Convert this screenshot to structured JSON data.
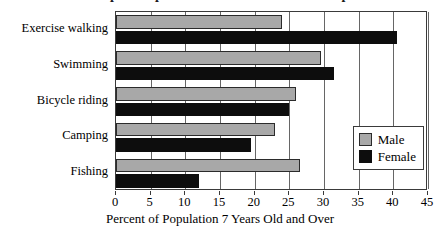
{
  "chart_data": {
    "type": "bar",
    "orientation": "horizontal",
    "title": "Most Popular Sports and Recreational Participation",
    "xlabel": "Percent of Population 7 Years Old and Over",
    "ylabel": "",
    "categories": [
      "Exercise walking",
      "Swimming",
      "Bicycle riding",
      "Camping",
      "Fishing"
    ],
    "series": [
      {
        "name": "Male",
        "color": "#a8a8a8",
        "values": [
          24,
          29.5,
          26,
          23,
          26.5
        ]
      },
      {
        "name": "Female",
        "color": "#0d0d0d",
        "values": [
          40.5,
          31.5,
          25,
          19.5,
          12
        ]
      }
    ],
    "xlim": [
      0,
      45
    ],
    "xticks": [
      0,
      5,
      10,
      15,
      20,
      25,
      30,
      35,
      40,
      45
    ],
    "xtick_labels": [
      "0",
      "5",
      "10",
      "15",
      "20",
      "25",
      "30",
      "35",
      "40",
      "45"
    ],
    "grid": "vertical",
    "legend_position": "inside-lower-right",
    "legend_entries": [
      "Male",
      "Female"
    ]
  }
}
